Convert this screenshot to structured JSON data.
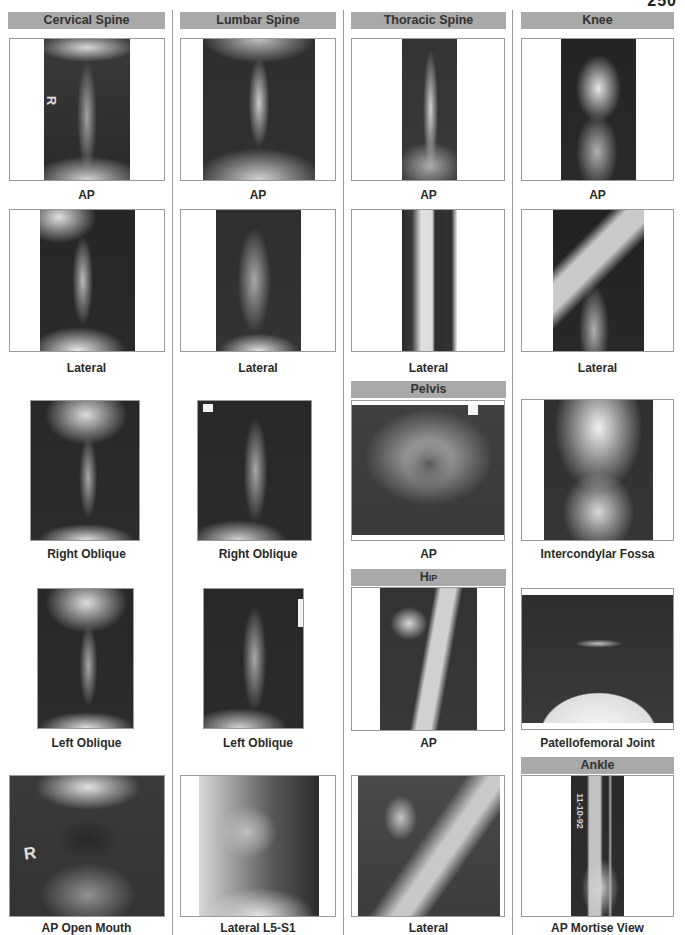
{
  "page": {
    "number_fragment": "250"
  },
  "columns": [
    {
      "header": "Cervical Spine",
      "views": [
        {
          "caption": "AP"
        },
        {
          "caption": "Lateral"
        },
        {
          "caption": "Right Oblique"
        },
        {
          "caption": "Left Oblique"
        },
        {
          "caption": "AP Open Mouth"
        }
      ]
    },
    {
      "header": "Lumbar Spine",
      "views": [
        {
          "caption": "AP"
        },
        {
          "caption": "Lateral"
        },
        {
          "caption": "Right Oblique"
        },
        {
          "caption": "Left Oblique"
        },
        {
          "caption": "Lateral L5-S1"
        }
      ]
    },
    {
      "header": "Thoracic Spine",
      "views": [
        {
          "caption": "AP"
        },
        {
          "caption": "Lateral"
        }
      ],
      "subsections": [
        {
          "header": "Pelvis",
          "views": [
            {
              "caption": "AP"
            }
          ]
        },
        {
          "header": "Hip",
          "views": [
            {
              "caption": "AP"
            },
            {
              "caption": "Lateral"
            }
          ]
        }
      ]
    },
    {
      "header": "Knee",
      "views": [
        {
          "caption": "AP"
        },
        {
          "caption": "Lateral"
        },
        {
          "caption": "Intercondylar Fossa"
        },
        {
          "caption": "Patellofemoral Joint"
        }
      ],
      "subsections": [
        {
          "header": "Ankle",
          "views": [
            {
              "caption": "AP Mortise View"
            }
          ]
        }
      ]
    }
  ],
  "image_markers": {
    "cervical_ap_marker": "R",
    "open_mouth_marker": "R",
    "lumbar_ro_marker": "R",
    "ankle_date": "11-10-92"
  },
  "colors": {
    "header_bar": "#a9a9a9",
    "frame_border": "#9a9a9a",
    "divider": "#9a9a9a",
    "text": "#2a2a2a"
  }
}
